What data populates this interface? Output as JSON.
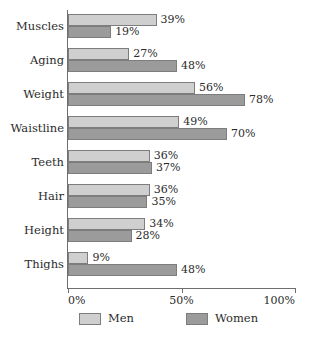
{
  "chart_data": {
    "type": "bar",
    "orientation": "horizontal",
    "title": "",
    "xlabel": "",
    "ylabel": "",
    "xlim": [
      0,
      100
    ],
    "xticks": [
      0,
      50,
      100
    ],
    "xtick_labels": [
      "0%",
      "50%",
      "100%"
    ],
    "grid": false,
    "legend_position": "bottom",
    "value_label_suffix": "%",
    "categories": [
      "Muscles",
      "Aging",
      "Weight",
      "Waistline",
      "Teeth",
      "Hair",
      "Height",
      "Thighs"
    ],
    "series": [
      {
        "name": "Men",
        "color": "#cfcfcf",
        "values": [
          39,
          27,
          56,
          49,
          36,
          36,
          34,
          9
        ],
        "value_labels": [
          "39%",
          "27%",
          "56%",
          "49%",
          "36%",
          "36%",
          "34%",
          "9%"
        ]
      },
      {
        "name": "Women",
        "color": "#9b9b9b",
        "values": [
          19,
          48,
          78,
          70,
          37,
          35,
          28,
          48
        ],
        "value_labels": [
          "19%",
          "48%",
          "78%",
          "70%",
          "37%",
          "35%",
          "28%",
          "48%"
        ]
      }
    ]
  },
  "legend": {
    "items": [
      {
        "label": "Men",
        "color": "#cfcfcf"
      },
      {
        "label": "Women",
        "color": "#9b9b9b"
      }
    ]
  },
  "axis": {
    "tick_labels": [
      "0%",
      "50%",
      "100%"
    ]
  },
  "colors": {
    "men_fill": "#cfcfcf",
    "women_fill": "#9b9b9b",
    "bar_stroke": "#7d7d7d",
    "axis": "#6f6f6f",
    "text": "#2b2b2b",
    "background": "#ffffff"
  }
}
